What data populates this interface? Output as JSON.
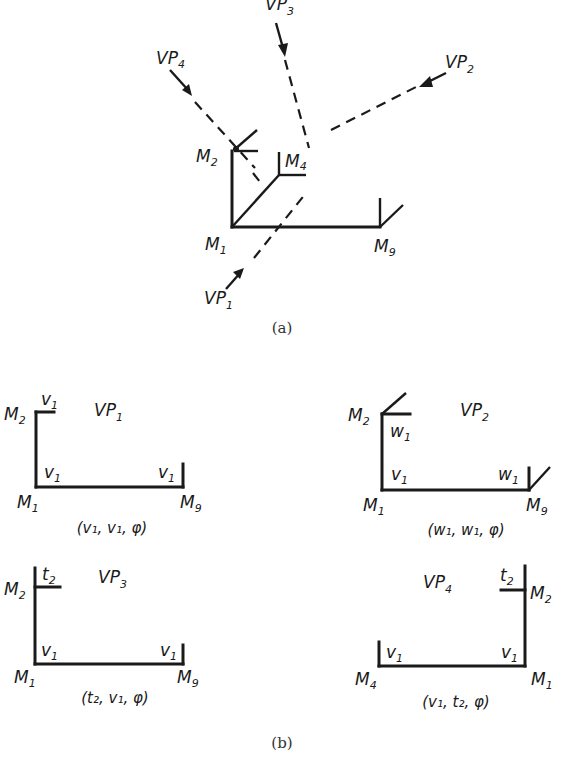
{
  "panel_a": {
    "caption": "(a)",
    "nodes": {
      "M1": "M",
      "M1_sub": "1",
      "M2": "M",
      "M2_sub": "2",
      "M4": "M",
      "M4_sub": "4",
      "M9": "M",
      "M9_sub": "9"
    },
    "viewpoints": {
      "VP1": {
        "label": "VP",
        "sub": "1"
      },
      "VP2": {
        "label": "VP",
        "sub": "2"
      },
      "VP3": {
        "label": "VP",
        "sub": "3"
      },
      "VP4": {
        "label": "VP",
        "sub": "4"
      }
    }
  },
  "panel_b": {
    "caption": "(b)",
    "views": [
      {
        "vp": "VP",
        "vp_sub": "1",
        "left_node": "M",
        "left_node_sub": "2",
        "bottom_left": "M",
        "bottom_left_sub": "1",
        "bottom_right": "M",
        "bottom_right_sub": "9",
        "top_tag": "v",
        "top_tag_sub": "1",
        "corner_tag": "v",
        "corner_tag_sub": "1",
        "right_tag": "v",
        "right_tag_sub": "1",
        "tuple": "(v₁, v₁, φ)"
      },
      {
        "vp": "VP",
        "vp_sub": "2",
        "left_node": "M",
        "left_node_sub": "2",
        "bottom_left": "M",
        "bottom_left_sub": "1",
        "bottom_right": "M",
        "bottom_right_sub": "9",
        "top_tag": "w",
        "top_tag_sub": "1",
        "corner_tag": "v",
        "corner_tag_sub": "1",
        "right_tag": "w",
        "right_tag_sub": "1",
        "tuple": "(w₁, w₁, φ)"
      },
      {
        "vp": "VP",
        "vp_sub": "3",
        "left_node": "M",
        "left_node_sub": "2",
        "bottom_left": "M",
        "bottom_left_sub": "1",
        "bottom_right": "M",
        "bottom_right_sub": "9",
        "top_tag": "t",
        "top_tag_sub": "2",
        "corner_tag": "v",
        "corner_tag_sub": "1",
        "right_tag": "v",
        "right_tag_sub": "1",
        "tuple": "(t₂, v₁, φ)"
      },
      {
        "vp": "VP",
        "vp_sub": "4",
        "right_node": "M",
        "right_node_sub": "2",
        "bottom_left": "M",
        "bottom_left_sub": "4",
        "bottom_right": "M",
        "bottom_right_sub": "1",
        "top_tag": "t",
        "top_tag_sub": "2",
        "corner_tag": "v",
        "corner_tag_sub": "1",
        "left_tag": "v",
        "left_tag_sub": "1",
        "tuple": "(v₁, t₂, φ)"
      }
    ]
  }
}
